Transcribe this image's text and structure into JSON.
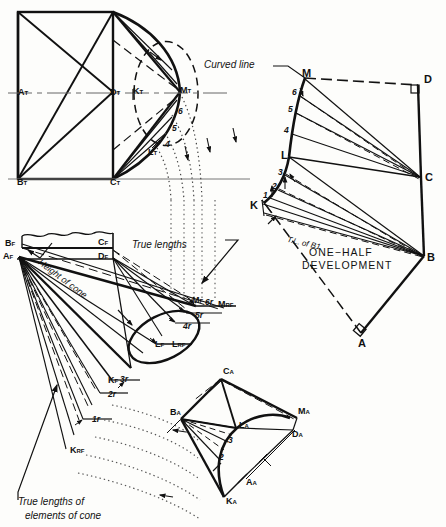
{
  "drawing": {
    "title": "Oblique cone development - true lengths of elements",
    "ink": "#111111",
    "light_ink": "#555555"
  },
  "annotations": {
    "curved_line": "Curved line",
    "true_lengths": "True lengths",
    "height_of_cone": "Height of cone",
    "true_lengths_elements": "True lengths of",
    "true_lengths_elements2": "elements of cone",
    "tl_of_b1": "T.L. of B1",
    "development_line1": "ONE−HALF",
    "development_line2": "DEVELOPMENT"
  },
  "top_view": {
    "points": [
      {
        "id": "A_T",
        "base": "A",
        "sub": "T",
        "x": 18,
        "y": 94
      },
      {
        "id": "D_T",
        "base": "D",
        "sub": "T",
        "x": 114,
        "y": 94
      },
      {
        "id": "K_T",
        "base": "K",
        "sub": "T",
        "x": 134,
        "y": 93
      },
      {
        "id": "M_T",
        "base": "M",
        "sub": "T",
        "x": 178,
        "y": 93
      },
      {
        "id": "B_T",
        "base": "B",
        "sub": "T",
        "x": 17,
        "y": 178
      },
      {
        "id": "C_T",
        "base": "C",
        "sub": "T",
        "x": 113,
        "y": 178
      },
      {
        "id": "L_T",
        "base": "L",
        "sub": "T",
        "x": 150,
        "y": 152
      }
    ],
    "element_numbers": [
      "6",
      "5",
      "4"
    ]
  },
  "front_view": {
    "points": [
      {
        "id": "B_F",
        "base": "B",
        "sub": "F",
        "x": 8,
        "y": 245
      },
      {
        "id": "A_F",
        "base": "A",
        "sub": "F",
        "x": 6,
        "y": 258
      },
      {
        "id": "C_F",
        "base": "C",
        "sub": "F",
        "x": 100,
        "y": 244
      },
      {
        "id": "D_F",
        "base": "D",
        "sub": "F",
        "x": 100,
        "y": 258
      },
      {
        "id": "M_F",
        "base": "M",
        "sub": "F",
        "x": 195,
        "y": 305
      },
      {
        "id": "L_F",
        "base": "L",
        "sub": "F",
        "x": 160,
        "y": 344
      },
      {
        "id": "K_F",
        "base": "K",
        "sub": "F",
        "x": 112,
        "y": 381
      },
      {
        "id": "M_RF",
        "base": "M",
        "sub": "RF",
        "x": 222,
        "y": 312
      },
      {
        "id": "L_RF",
        "base": "L",
        "sub": "RF",
        "x": 176,
        "y": 351
      },
      {
        "id": "K_RF",
        "base": "K",
        "sub": "RF",
        "x": 75,
        "y": 451
      }
    ],
    "true_length_marks": [
      "6r",
      "5r",
      "4r",
      "3r",
      "2r",
      "1r"
    ]
  },
  "development": {
    "points": [
      {
        "id": "M",
        "base": "M",
        "sub": "",
        "x": 305,
        "y": 77
      },
      {
        "id": "D",
        "base": "D",
        "sub": "",
        "x": 424,
        "y": 83
      },
      {
        "id": "C",
        "base": "C",
        "sub": "",
        "x": 425,
        "y": 178
      },
      {
        "id": "B",
        "base": "B",
        "sub": "",
        "x": 426,
        "y": 258
      },
      {
        "id": "A",
        "base": "A",
        "sub": "",
        "x": 363,
        "y": 342
      },
      {
        "id": "L",
        "base": "L",
        "sub": "",
        "x": 289,
        "y": 156
      },
      {
        "id": "K",
        "base": "K",
        "sub": "",
        "x": 260,
        "y": 207
      }
    ],
    "element_numbers": [
      "6",
      "5",
      "4",
      "3",
      "2",
      "1"
    ]
  },
  "aux_view": {
    "points": [
      {
        "id": "C_A",
        "base": "C",
        "sub": "A",
        "x": 229,
        "y": 373
      },
      {
        "id": "B_A",
        "base": "B",
        "sub": "A",
        "x": 178,
        "y": 412
      },
      {
        "id": "L_A",
        "base": "L",
        "sub": "A",
        "x": 243,
        "y": 425
      },
      {
        "id": "M_A",
        "base": "M",
        "sub": "A",
        "x": 302,
        "y": 413
      },
      {
        "id": "D_A",
        "base": "D",
        "sub": "A",
        "x": 296,
        "y": 436
      },
      {
        "id": "A_A",
        "base": "A",
        "sub": "A",
        "x": 250,
        "y": 483
      },
      {
        "id": "K_A",
        "base": "K",
        "sub": "A",
        "x": 230,
        "y": 501
      }
    ],
    "element_numbers": [
      "3",
      "2"
    ]
  }
}
